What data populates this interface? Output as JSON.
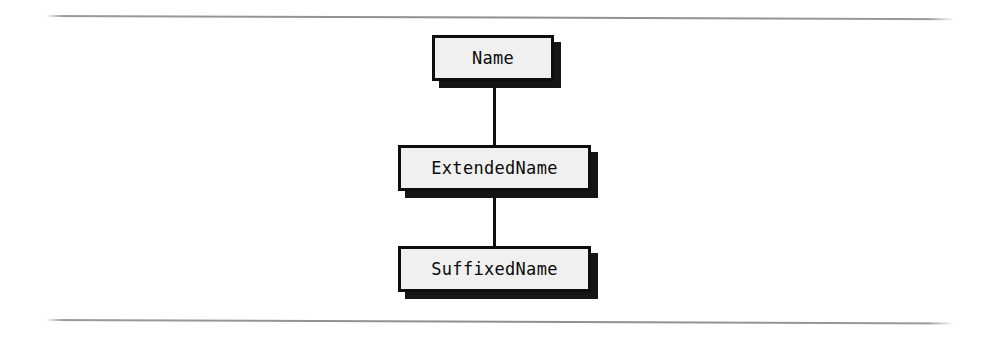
{
  "diagram": {
    "type": "inheritance-hierarchy",
    "background_color": "#ffffff",
    "node_fill_color": "#eff0ef",
    "node_border_color": "#0d0d0d",
    "node_shadow_color": "#151515",
    "rule_color": "#8e8e8e",
    "connector_color": "#101010",
    "nodes": [
      {
        "id": "name",
        "label": "Name"
      },
      {
        "id": "extended",
        "label": "ExtendedName"
      },
      {
        "id": "suffixed",
        "label": "SuffixedName"
      }
    ],
    "edges": [
      {
        "id": "name-extended",
        "from": "Name",
        "to": "ExtendedName"
      },
      {
        "id": "extended-suffixed",
        "from": "ExtendedName",
        "to": "SuffixedName"
      }
    ],
    "rules": [
      {
        "id": "top",
        "position": "top"
      },
      {
        "id": "bottom",
        "position": "bottom"
      }
    ]
  }
}
